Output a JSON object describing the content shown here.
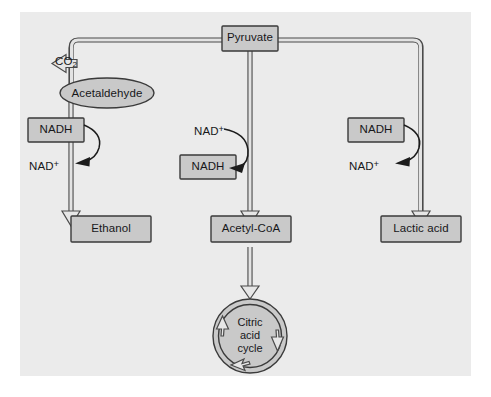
{
  "figure": {
    "background_color": "#ffffff",
    "panel_color": "#ebebeb",
    "node_fill_color": "#c9c9c9",
    "stroke_color": "#3a3a3a",
    "text_color": "#17171a"
  },
  "nodes": {
    "pyruvate": {
      "label": "Pyruvate",
      "shape": "rect"
    },
    "co2": {
      "label": "CO",
      "sub": "2",
      "shape": "text"
    },
    "acetaldehyde": {
      "label": "Acetaldehyde",
      "shape": "ellipse"
    },
    "ethanol": {
      "label": "Ethanol",
      "shape": "rect"
    },
    "acetyl_coa": {
      "label": "Acetyl-CoA",
      "shape": "rect"
    },
    "lactic_acid": {
      "label": "Lactic acid",
      "shape": "rect"
    },
    "citric_acid_cycle": {
      "line1": "Citric",
      "line2": "acid",
      "line3": "cycle",
      "shape": "circle"
    }
  },
  "cofactors": {
    "left_branch": {
      "box_label": "NADH",
      "product_label": "NAD",
      "product_sup": "+"
    },
    "middle_branch": {
      "reactant_label": "NAD",
      "reactant_sup": "+",
      "box_label": "NADH"
    },
    "right_branch": {
      "box_label": "NADH",
      "product_label": "NAD",
      "product_sup": "+"
    }
  },
  "pathways": [
    {
      "name": "alcoholic-fermentation",
      "from": "Pyruvate",
      "via": "Acetaldehyde",
      "to": "Ethanol",
      "releases": "CO2"
    },
    {
      "name": "aerobic-oxidation",
      "from": "Pyruvate",
      "to": "Acetyl-CoA",
      "then": "Citric acid cycle"
    },
    {
      "name": "lactic-fermentation",
      "from": "Pyruvate",
      "to": "Lactic acid"
    }
  ]
}
